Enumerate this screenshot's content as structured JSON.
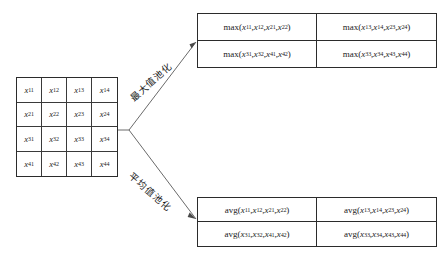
{
  "diagram": {
    "input_matrix": {
      "name": "input-feature-map",
      "rows": 4,
      "cols": 4,
      "cells": [
        {
          "base": "x",
          "sub": "11"
        },
        {
          "base": "x",
          "sub": "12"
        },
        {
          "base": "x",
          "sub": "13"
        },
        {
          "base": "x",
          "sub": "14"
        },
        {
          "base": "x",
          "sub": "21"
        },
        {
          "base": "x",
          "sub": "22"
        },
        {
          "base": "x",
          "sub": "23"
        },
        {
          "base": "x",
          "sub": "24"
        },
        {
          "base": "x",
          "sub": "31"
        },
        {
          "base": "x",
          "sub": "32"
        },
        {
          "base": "x",
          "sub": "33"
        },
        {
          "base": "x",
          "sub": "34"
        },
        {
          "base": "x",
          "sub": "41"
        },
        {
          "base": "x",
          "sub": "42"
        },
        {
          "base": "x",
          "sub": "43"
        },
        {
          "base": "x",
          "sub": "44"
        }
      ]
    },
    "branches": [
      {
        "id": "max",
        "label": "最大值池化"
      },
      {
        "id": "avg",
        "label": "平均值池化"
      }
    ],
    "max_output": {
      "name": "max-pooling-output",
      "function": "max",
      "rows": 2,
      "cols": 2,
      "cells": [
        {
          "fn": "max",
          "args": [
            "11",
            "12",
            "21",
            "22"
          ]
        },
        {
          "fn": "max",
          "args": [
            "13",
            "14",
            "23",
            "24"
          ]
        },
        {
          "fn": "max",
          "args": [
            "31",
            "32",
            "41",
            "42"
          ]
        },
        {
          "fn": "max",
          "args": [
            "33",
            "34",
            "43",
            "44"
          ]
        }
      ]
    },
    "avg_output": {
      "name": "average-pooling-output",
      "function": "avg",
      "rows": 2,
      "cols": 2,
      "cells": [
        {
          "fn": "avg",
          "args": [
            "11",
            "12",
            "21",
            "22"
          ]
        },
        {
          "fn": "avg",
          "args": [
            "13",
            "14",
            "23",
            "24"
          ]
        },
        {
          "fn": "avg",
          "args": [
            "31",
            "32",
            "41",
            "42"
          ]
        },
        {
          "fn": "avg",
          "args": [
            "33",
            "34",
            "43",
            "44"
          ]
        }
      ]
    },
    "colors": {
      "line": "#2b2b2b",
      "inner_line": "#3a3a3a",
      "text": "#1b1b1b",
      "background": "#ffffff"
    }
  }
}
